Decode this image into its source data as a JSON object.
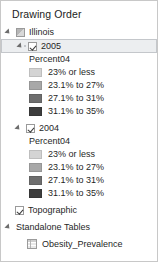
{
  "panel": {
    "title": "Drawing Order"
  },
  "tree": {
    "root": {
      "label": "Illinois",
      "expander_icon": "expander-triangle-icon",
      "layer_icon": "layer-raster-icon"
    },
    "groups": [
      {
        "label": "2005",
        "checked": true,
        "selected": true,
        "field": "Percent04",
        "legend": [
          {
            "label": "23% or less",
            "color": "#d4d4d4"
          },
          {
            "label": "23.1% to 27%",
            "color": "#a8a8a8"
          },
          {
            "label": "27.1% to 31%",
            "color": "#6e6e6e"
          },
          {
            "label": "31.1% to 35%",
            "color": "#3d3d3d"
          }
        ]
      },
      {
        "label": "2004",
        "checked": true,
        "selected": false,
        "field": "Percent04",
        "legend": [
          {
            "label": "23% or less",
            "color": "#d4d4d4"
          },
          {
            "label": "23.1% to 27%",
            "color": "#a8a8a8"
          },
          {
            "label": "27.1% to 31%",
            "color": "#6e6e6e"
          },
          {
            "label": "31.1% to 35%",
            "color": "#3d3d3d"
          }
        ]
      }
    ],
    "basemap": {
      "label": "Topographic",
      "checked": true
    },
    "standalone_tables": {
      "label": "Standalone Tables",
      "expander_icon": "expander-triangle-icon",
      "items": [
        {
          "label": "Obesity_Prevalence",
          "icon": "table-grid-icon"
        }
      ]
    }
  },
  "colors": {
    "panel_border": "#c8c8c8",
    "selection_fill": "#ebedef",
    "selection_border": "#c3c6ca",
    "text": "#1f1f1f"
  }
}
